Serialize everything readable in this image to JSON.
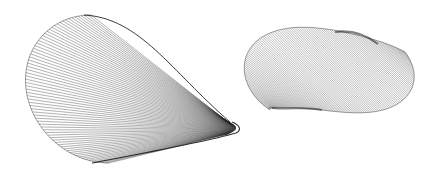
{
  "figure": {
    "background": "#ffffff",
    "line_color": "#1a1a1a",
    "panels": [
      {
        "id": "left",
        "name": "cone-like ruled surface",
        "rulings": 70,
        "rim": {
          "cx": 128,
          "cy": 88,
          "rx": 100,
          "ry": 74,
          "start_deg": 108,
          "end_deg": 252
        },
        "apex": {
          "x": 237,
          "y": 130
        },
        "apex_spread": 7
      },
      {
        "id": "right",
        "name": "twisted band ruled surface",
        "rulings": 110
      }
    ]
  }
}
